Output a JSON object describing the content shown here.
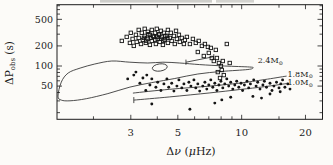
{
  "figure": {
    "description_visible_text_only": true,
    "colors": {
      "background": "#fcfbf8",
      "ink": "#1c1c1c",
      "track_line": "#3a3a3a",
      "marker": "#151515",
      "scan_artifact": "#c6c6c2"
    }
  },
  "chart_data": {
    "type": "scatter",
    "x_scale": "log",
    "y_scale": "log",
    "xlabel_parts": {
      "delta": "Δ",
      "nu_italic": "ν",
      "paren_open": " (",
      "mu_italic": "μ",
      "unit_end": "Hz)"
    },
    "ylabel_parts": {
      "main": "ΔP",
      "sub": "obs",
      "unit": " (s)"
    },
    "xlim": [
      1.346,
      24.06
    ],
    "ylim": [
      15.9,
      829
    ],
    "x_ticks_labeled": [
      3,
      5,
      10,
      20
    ],
    "x_ticks_minor": [
      2,
      4,
      6,
      7,
      8,
      9,
      15
    ],
    "y_ticks_labeled": [
      50,
      100,
      200,
      500
    ],
    "y_ticks_minor": [
      20,
      30,
      40,
      60,
      70,
      80,
      90,
      300,
      400,
      600,
      700,
      800
    ],
    "grid": false,
    "legend": "none",
    "series": [
      {
        "name": "open-squares",
        "marker": "open-square",
        "points": [
          [
            2.72,
            238
          ],
          [
            2.87,
            273
          ],
          [
            2.97,
            222
          ],
          [
            3.0,
            314
          ],
          [
            3.06,
            255
          ],
          [
            3.1,
            200
          ],
          [
            3.17,
            293
          ],
          [
            3.2,
            230
          ],
          [
            3.27,
            348
          ],
          [
            3.27,
            264
          ],
          [
            3.35,
            214
          ],
          [
            3.38,
            314
          ],
          [
            3.42,
            246
          ],
          [
            3.49,
            283
          ],
          [
            3.49,
            361
          ],
          [
            3.53,
            222
          ],
          [
            3.61,
            325
          ],
          [
            3.61,
            255
          ],
          [
            3.69,
            293
          ],
          [
            3.69,
            207
          ],
          [
            3.77,
            348
          ],
          [
            3.77,
            238
          ],
          [
            3.85,
            273
          ],
          [
            3.9,
            314
          ],
          [
            3.94,
            214
          ],
          [
            3.98,
            361
          ],
          [
            4.02,
            255
          ],
          [
            4.07,
            293
          ],
          [
            4.11,
            230
          ],
          [
            4.16,
            337
          ],
          [
            4.2,
            273
          ],
          [
            4.25,
            207
          ],
          [
            4.3,
            314
          ],
          [
            4.34,
            246
          ],
          [
            4.44,
            283
          ],
          [
            4.49,
            348
          ],
          [
            4.49,
            222
          ],
          [
            4.58,
            264
          ],
          [
            4.63,
            314
          ],
          [
            4.68,
            238
          ],
          [
            4.79,
            283
          ],
          [
            4.84,
            214
          ],
          [
            4.9,
            337
          ],
          [
            4.95,
            255
          ],
          [
            5.06,
            293
          ],
          [
            5.11,
            230
          ],
          [
            5.22,
            264
          ],
          [
            5.34,
            214
          ],
          [
            5.4,
            246
          ],
          [
            5.52,
            273
          ],
          [
            5.7,
            214
          ],
          [
            5.89,
            255
          ],
          [
            6.08,
            222
          ],
          [
            6.27,
            238
          ],
          [
            6.49,
            200
          ],
          [
            6.71,
            214
          ],
          [
            6.93,
            193
          ],
          [
            6.21,
            162
          ],
          [
            6.63,
            141
          ],
          [
            7.0,
            157
          ],
          [
            7.23,
            132
          ],
          [
            7.39,
            119
          ],
          [
            7.64,
            132
          ],
          [
            7.81,
            111
          ],
          [
            7.98,
            100
          ],
          [
            8.15,
            119
          ],
          [
            8.06,
            87
          ],
          [
            7.72,
            81
          ],
          [
            8.24,
            73
          ],
          [
            7.9,
            66
          ],
          [
            8.51,
            214
          ],
          [
            8.78,
            111
          ],
          [
            7.55,
            174
          ],
          [
            7.15,
            187
          ],
          [
            3.46,
            264
          ],
          [
            3.55,
            238
          ],
          [
            3.63,
            300
          ],
          [
            3.72,
            264
          ],
          [
            3.81,
            283
          ],
          [
            3.92,
            246
          ],
          [
            4.0,
            273
          ],
          [
            4.09,
            300
          ],
          [
            4.18,
            255
          ],
          [
            4.27,
            238
          ],
          [
            4.37,
            283
          ],
          [
            4.47,
            264
          ]
        ]
      },
      {
        "name": "filled-circles",
        "marker": "filled-circle",
        "points": [
          [
            2.9,
            64
          ],
          [
            3.1,
            73
          ],
          [
            3.31,
            55
          ],
          [
            3.42,
            66
          ],
          [
            3.53,
            43
          ],
          [
            3.69,
            52
          ],
          [
            3.77,
            64
          ],
          [
            3.94,
            48
          ],
          [
            4.02,
            57
          ],
          [
            4.16,
            43
          ],
          [
            4.3,
            54
          ],
          [
            4.44,
            64
          ],
          [
            4.53,
            48
          ],
          [
            4.68,
            55
          ],
          [
            4.79,
            42
          ],
          [
            4.95,
            50
          ],
          [
            5.06,
            62
          ],
          [
            5.22,
            47
          ],
          [
            5.34,
            54
          ],
          [
            5.52,
            43
          ],
          [
            5.64,
            57
          ],
          [
            5.76,
            50
          ],
          [
            5.95,
            62
          ],
          [
            6.08,
            47
          ],
          [
            6.21,
            54
          ],
          [
            6.34,
            42
          ],
          [
            6.56,
            50
          ],
          [
            6.71,
            57
          ],
          [
            6.85,
            45
          ],
          [
            7.0,
            52
          ],
          [
            7.15,
            62
          ],
          [
            7.31,
            48
          ],
          [
            7.47,
            55
          ],
          [
            7.64,
            43
          ],
          [
            7.81,
            52
          ],
          [
            7.98,
            59
          ],
          [
            8.15,
            47
          ],
          [
            8.33,
            54
          ],
          [
            8.51,
            64
          ],
          [
            8.69,
            50
          ],
          [
            8.88,
            57
          ],
          [
            9.08,
            45
          ],
          [
            9.28,
            52
          ],
          [
            9.48,
            59
          ],
          [
            9.69,
            48
          ],
          [
            9.93,
            55
          ],
          [
            10.1,
            43
          ],
          [
            10.3,
            52
          ],
          [
            10.6,
            59
          ],
          [
            10.8,
            47
          ],
          [
            11.0,
            54
          ],
          [
            11.4,
            62
          ],
          [
            11.7,
            50
          ],
          [
            11.9,
            57
          ],
          [
            12.2,
            45
          ],
          [
            12.6,
            52
          ],
          [
            12.8,
            59
          ],
          [
            13.1,
            48
          ],
          [
            13.6,
            55
          ],
          [
            13.9,
            43
          ],
          [
            14.2,
            50
          ],
          [
            14.6,
            57
          ],
          [
            15.0,
            47
          ],
          [
            15.3,
            54
          ],
          [
            15.6,
            62
          ],
          [
            16.0,
            48
          ],
          [
            16.5,
            54
          ],
          [
            16.9,
            45
          ],
          [
            3.77,
            27
          ],
          [
            5.7,
            22.5
          ],
          [
            7.47,
            27.8
          ],
          [
            8.06,
            31
          ],
          [
            11.3,
            35
          ],
          [
            12.4,
            33
          ],
          [
            13.6,
            38
          ],
          [
            15.2,
            41
          ],
          [
            8.88,
            34
          ],
          [
            3.17,
            81
          ],
          [
            3.57,
            73
          ]
        ]
      }
    ],
    "tracks": [
      {
        "name": "track-2p4msun",
        "label_main": "2.4M",
        "label_sun": "⊙",
        "closed": true,
        "label_anchor": [
          11.9,
          122
        ],
        "points": [
          [
            1.36,
            35.4
          ],
          [
            1.41,
            57.4
          ],
          [
            1.52,
            78.5
          ],
          [
            1.73,
            93.0
          ],
          [
            2.03,
            107
          ],
          [
            2.44,
            119
          ],
          [
            2.97,
            114
          ],
          [
            3.61,
            111
          ],
          [
            4.25,
            114
          ],
          [
            5.11,
            111
          ],
          [
            6.34,
            105
          ],
          [
            8.32,
            100
          ],
          [
            10.9,
            96.7
          ],
          [
            11.3,
            93.5
          ],
          [
            10.7,
            88.7
          ],
          [
            8.06,
            82.9
          ],
          [
            6.21,
            76
          ],
          [
            4.84,
            64.9
          ],
          [
            3.77,
            56.4
          ],
          [
            2.97,
            48.3
          ],
          [
            2.34,
            38.6
          ],
          [
            1.85,
            32.4
          ],
          [
            1.55,
            30.1
          ],
          [
            1.41,
            30.8
          ]
        ],
        "loop_ellipse": {
          "center": [
            4.11,
            95
          ],
          "rx_px": 7.5,
          "ry_px": 3.6,
          "rotation_deg": -8
        }
      },
      {
        "name": "track-1p8msun",
        "label_main": "1.8M",
        "label_sun": "⊙",
        "closed": false,
        "label_anchor": [
          16.45,
          76
        ],
        "points": [
          [
            3.07,
            39.3
          ],
          [
            4.58,
            44.8
          ],
          [
            7.08,
            50
          ],
          [
            9.8,
            55.5
          ],
          [
            12.8,
            62.5
          ],
          [
            16.3,
            70.7
          ]
        ]
      },
      {
        "name": "track-1p0msun",
        "label_main": "1.0M",
        "label_sun": "⊙",
        "closed": false,
        "label_anchor": [
          16.45,
          56.8
        ],
        "points": [
          [
            3.1,
            30.8
          ],
          [
            4.58,
            34.4
          ],
          [
            7.08,
            39.6
          ],
          [
            9.8,
            44.4
          ],
          [
            12.8,
            48.9
          ],
          [
            16.3,
            54.5
          ]
        ]
      }
    ],
    "annotations": [
      {
        "name": "error-bar-segment",
        "caps": true,
        "points": [
          [
            5.46,
            114
          ],
          [
            7.39,
            138
          ]
        ]
      },
      {
        "name": "track-left-endcap",
        "caps": false,
        "points": [
          [
            3.1,
            34.2
          ],
          [
            3.1,
            27.8
          ]
        ]
      }
    ]
  }
}
